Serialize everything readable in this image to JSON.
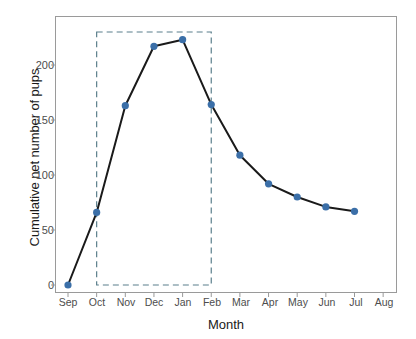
{
  "chart_data": {
    "type": "line",
    "title": "",
    "xlabel": "Month",
    "ylabel": "Cumulative net number of pups",
    "categories": [
      "Sep",
      "Oct",
      "Nov",
      "Dec",
      "Jan",
      "Feb",
      "Mar",
      "Apr",
      "May",
      "Jun",
      "Jul",
      "Aug"
    ],
    "values": [
      0,
      66,
      163,
      217,
      223,
      164,
      118,
      92,
      80,
      71,
      67,
      null
    ],
    "series": [
      {
        "name": "Cumulative net number of pups",
        "values": [
          0,
          66,
          163,
          217,
          223,
          164,
          118,
          92,
          80,
          71,
          67,
          null
        ]
      }
    ],
    "ylim": [
      -8,
      232
    ],
    "yticks": [
      0,
      50,
      100,
      150,
      200
    ],
    "ytick_labels": [
      "0",
      "50",
      "100",
      "150",
      "200"
    ],
    "xtick_labels": [
      "Sep",
      "Oct",
      "Nov",
      "Dec",
      "Jan",
      "Feb",
      "Mar",
      "Apr",
      "May",
      "Jun",
      "Jul",
      "Aug"
    ],
    "grid": false,
    "legend": null,
    "annotations": [
      {
        "type": "dashed-rectangle",
        "label": "breeding-season-highlight",
        "x_start": "Oct",
        "x_end": "Feb",
        "y_start": 0,
        "y_end": 230,
        "color": "#5b7f8c",
        "style": "dashed"
      }
    ],
    "colors": {
      "point": "#3b6fa8",
      "line": "#1a1a1a",
      "panel_border": "#9a9a9a",
      "annotation": "#5b7f8c",
      "tick_text": "#4d4d4d",
      "axis_title": "#1a1a1a",
      "background": "#ffffff"
    }
  }
}
